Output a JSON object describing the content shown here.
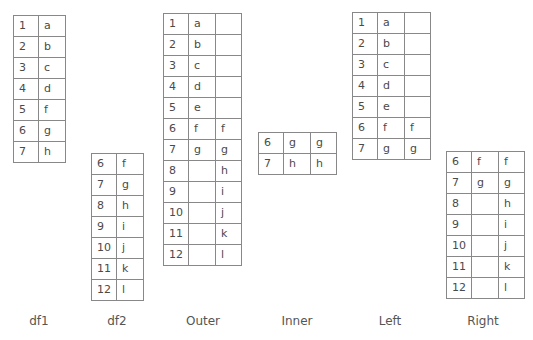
{
  "tables": {
    "df1": {
      "label": "df1",
      "rows": [
        [
          "1",
          "a"
        ],
        [
          "2",
          "b"
        ],
        [
          "3",
          "c"
        ],
        [
          "4",
          "d"
        ],
        [
          "5",
          "f"
        ],
        [
          "6",
          "g"
        ],
        [
          "7",
          "h"
        ]
      ]
    },
    "df2": {
      "label": "df2",
      "rows": [
        [
          "6",
          "f"
        ],
        [
          "7",
          "g"
        ],
        [
          "8",
          "h"
        ],
        [
          "9",
          "i"
        ],
        [
          "10",
          "j"
        ],
        [
          "11",
          "k"
        ],
        [
          "12",
          "l"
        ]
      ]
    },
    "outer": {
      "label": "Outer",
      "rows": [
        [
          "1",
          "a",
          ""
        ],
        [
          "2",
          "b",
          ""
        ],
        [
          "3",
          "c",
          ""
        ],
        [
          "4",
          "d",
          ""
        ],
        [
          "5",
          "e",
          ""
        ],
        [
          "6",
          "f",
          "f"
        ],
        [
          "7",
          "g",
          "g"
        ],
        [
          "8",
          "",
          "h"
        ],
        [
          "9",
          "",
          "i"
        ],
        [
          "10",
          "",
          "j"
        ],
        [
          "11",
          "",
          "k"
        ],
        [
          "12",
          "",
          "l"
        ]
      ]
    },
    "inner": {
      "label": "Inner",
      "rows": [
        [
          "6",
          "g",
          "g"
        ],
        [
          "7",
          "h",
          "h"
        ]
      ]
    },
    "left": {
      "label": "Left",
      "rows": [
        [
          "1",
          "a",
          ""
        ],
        [
          "2",
          "b",
          ""
        ],
        [
          "3",
          "c",
          ""
        ],
        [
          "4",
          "d",
          ""
        ],
        [
          "5",
          "e",
          ""
        ],
        [
          "6",
          "f",
          "f"
        ],
        [
          "7",
          "g",
          "g"
        ]
      ]
    },
    "right": {
      "label": "Right",
      "rows": [
        [
          "6",
          "f",
          "f"
        ],
        [
          "7",
          "g",
          "g"
        ],
        [
          "8",
          "",
          "h"
        ],
        [
          "9",
          "",
          "i"
        ],
        [
          "10",
          "",
          "j"
        ],
        [
          "11",
          "",
          "k"
        ],
        [
          "12",
          "",
          "l"
        ]
      ]
    }
  }
}
